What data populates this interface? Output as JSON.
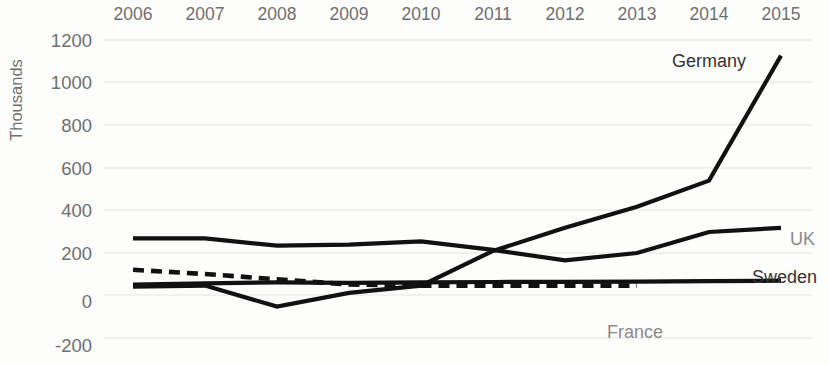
{
  "chart_data": {
    "type": "line",
    "title": "",
    "subtitle": "",
    "xlabel": "",
    "ylabel": "Thousands",
    "x": [
      2006,
      2007,
      2008,
      2009,
      2010,
      2011,
      2012,
      2013,
      2014,
      2015
    ],
    "categories": [
      "2006",
      "2007",
      "2008",
      "2009",
      "2010",
      "2011",
      "2012",
      "2013",
      "2014",
      "2015"
    ],
    "ylim": [
      -200,
      1200
    ],
    "yticks": [
      -200,
      0,
      200,
      400,
      600,
      800,
      1000,
      1200
    ],
    "ytick_labels": [
      "-200",
      "0",
      "200",
      "400",
      "600",
      "800",
      "1000",
      "1200"
    ],
    "grid": true,
    "grid_axis": "y",
    "legend": "inline-end-labels",
    "series": [
      {
        "name": "Germany",
        "label": "Germany",
        "style": "solid",
        "color": "#111111",
        "label_position": "above-right",
        "values": [
          40,
          45,
          -55,
          10,
          45,
          210,
          320,
          420,
          545,
          1140
        ]
      },
      {
        "name": "UK",
        "label": "UK",
        "style": "solid",
        "color": "#111111",
        "label_position": "end-right",
        "values": [
          270,
          270,
          235,
          240,
          255,
          215,
          165,
          200,
          300,
          320
        ]
      },
      {
        "name": "Sweden",
        "label": "Sweden",
        "style": "solid",
        "color": "#111111",
        "label_position": "end-right",
        "values": [
          50,
          55,
          60,
          58,
          60,
          62,
          63,
          64,
          66,
          68
        ]
      },
      {
        "name": "France",
        "label": "France",
        "style": "dashed",
        "color": "#111111",
        "label_position": "below-center",
        "values": [
          120,
          100,
          75,
          50,
          45,
          45,
          45,
          45,
          null,
          null
        ]
      }
    ]
  },
  "axis": {
    "y_title": "Thousands",
    "y_labels": [
      "1200",
      "1000",
      "800",
      "600",
      "400",
      "200",
      "0",
      "-200"
    ],
    "x_labels": [
      "2006",
      "2007",
      "2008",
      "2009",
      "2010",
      "2011",
      "2012",
      "2013",
      "2014",
      "2015"
    ]
  },
  "series_labels": {
    "germany": "Germany",
    "uk": "UK",
    "sweden": "Sweden",
    "france": "France"
  }
}
